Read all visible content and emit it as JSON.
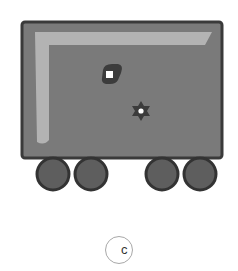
{
  "figure": {
    "colors": {
      "body_fill": "#7a7a7a",
      "body_border": "#3a3a3a",
      "highlight": "#bdbdbd",
      "wheel_fill": "#5e5e5e",
      "wheel_border": "#333333",
      "marker_dark": "#3c3c3c",
      "marker_light": "#ffffff",
      "option_circle": "#a8a8a8"
    },
    "wheels": 4,
    "markers": [
      "square-marker",
      "star-marker"
    ]
  },
  "option": {
    "label": "c"
  }
}
